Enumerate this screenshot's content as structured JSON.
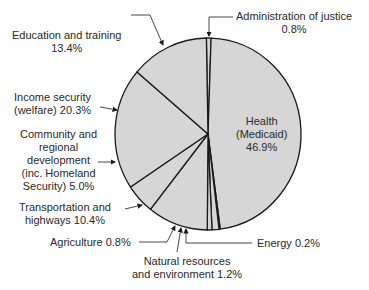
{
  "chart_data": {
    "type": "pie",
    "title": "",
    "start_angle_deg": -1,
    "direction": "clockwise",
    "fill_color": "#d6d6d6",
    "edge_color": "#1a1a1a",
    "slices": [
      {
        "label": "Administration of justice",
        "value": 0.8
      },
      {
        "label": "Health (Medicaid)",
        "value": 46.9
      },
      {
        "label": "Energy",
        "value": 0.2
      },
      {
        "label": "Natural resources and environment",
        "value": 1.2
      },
      {
        "label": "Agriculture",
        "value": 0.8
      },
      {
        "label": "Transportation and highways",
        "value": 10.4
      },
      {
        "label": "Community and regional development (inc. Homeland Security)",
        "value": 5.0
      },
      {
        "label": "Income security (welfare)",
        "value": 20.3
      },
      {
        "label": "Education and training",
        "value": 13.4
      }
    ]
  },
  "labels": {
    "justice": {
      "line1": "Administration of justice",
      "line2": "0.8%"
    },
    "health": {
      "line1": "Health",
      "line2": "(Medicaid)",
      "line3": "46.9%"
    },
    "energy": {
      "line1": "Energy 0.2%"
    },
    "natural": {
      "line1": "Natural resources",
      "line2": "and environment 1.2%"
    },
    "agriculture": {
      "line1": "Agriculture 0.8%"
    },
    "transport": {
      "line1": "Transportation and",
      "line2": "highways 10.4%"
    },
    "community": {
      "line1": "Community and",
      "line2": "regional",
      "line3": "development",
      "line4": "(inc. Homeland",
      "line5": "Security) 5.0%"
    },
    "income": {
      "line1": "Income security",
      "line2": "(welfare) 20.3%"
    },
    "education": {
      "line1": "Education and training",
      "line2": "13.4%"
    }
  }
}
